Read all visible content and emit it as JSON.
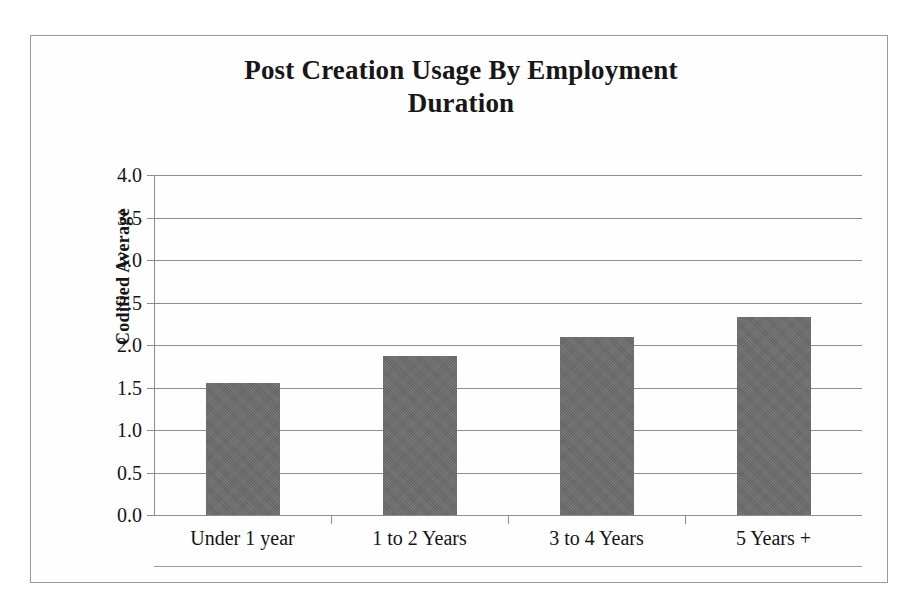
{
  "chart_data": {
    "type": "bar",
    "title": "Post Creation Usage By Employment Duration",
    "title_line1": "Post Creation Usage By Employment",
    "title_line2": "Duration",
    "xlabel": "",
    "ylabel": "Codified Average",
    "categories": [
      "Under 1 year",
      "1 to 2 Years",
      "3 to 4 Years",
      "5 Years +"
    ],
    "values": [
      1.55,
      1.87,
      2.1,
      2.33
    ],
    "ylim": [
      0.0,
      4.0
    ],
    "ytick_step": 0.5,
    "ytick_labels": [
      "4.0",
      "3.5",
      "3.0",
      "2.5",
      "2.0",
      "1.5",
      "1.0",
      "0.5",
      "0.0"
    ],
    "ytick_values": [
      4.0,
      3.5,
      3.0,
      2.5,
      2.0,
      1.5,
      1.0,
      0.5,
      0.0
    ],
    "grid": true,
    "legend": false,
    "bar_color": "#6c6c6c",
    "grid_color": "#8d8d8d",
    "frame_color": "#9a9a9a",
    "text_color": "#141414"
  }
}
